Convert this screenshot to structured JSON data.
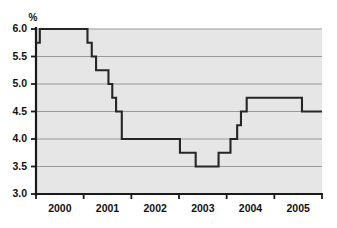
{
  "chart_data": {
    "type": "line",
    "subtype": "step",
    "title": "",
    "subtitle": "",
    "xlabel": "",
    "ylabel": "%",
    "ylim": [
      3.0,
      6.0
    ],
    "xlim": [
      1999.5,
      2005.5
    ],
    "grid": true,
    "legend": null,
    "y_ticks": [
      "6.0",
      "5.5",
      "5.0",
      "4.5",
      "4.0",
      "3.5",
      "3.0"
    ],
    "y_tick_values": [
      6.0,
      5.5,
      5.0,
      4.5,
      4.0,
      3.5,
      3.0
    ],
    "x_ticks": [
      "2000",
      "2001",
      "2002",
      "2003",
      "2004",
      "2005"
    ],
    "x_tick_values": [
      2000,
      2001,
      2002,
      2003,
      2004,
      2005
    ],
    "x_tick_mark_values": [
      1999.5,
      2000.5,
      2001.5,
      2002.5,
      2003.5,
      2004.5,
      2005.5
    ],
    "series": [
      {
        "name": "rate",
        "step": "post",
        "points": [
          {
            "x": 1999.5,
            "y": 5.75
          },
          {
            "x": 1999.58,
            "y": 6.0
          },
          {
            "x": 2000.58,
            "y": 5.75
          },
          {
            "x": 2000.67,
            "y": 5.5
          },
          {
            "x": 2000.76,
            "y": 5.25
          },
          {
            "x": 2001.02,
            "y": 5.0
          },
          {
            "x": 2001.1,
            "y": 4.75
          },
          {
            "x": 2001.18,
            "y": 4.5
          },
          {
            "x": 2001.3,
            "y": 4.0
          },
          {
            "x": 2002.52,
            "y": 3.75
          },
          {
            "x": 2002.85,
            "y": 3.5
          },
          {
            "x": 2003.33,
            "y": 3.75
          },
          {
            "x": 2003.58,
            "y": 4.0
          },
          {
            "x": 2003.72,
            "y": 4.25
          },
          {
            "x": 2003.8,
            "y": 4.5
          },
          {
            "x": 2003.92,
            "y": 4.75
          },
          {
            "x": 2005.08,
            "y": 4.5
          },
          {
            "x": 2005.5,
            "y": 4.5
          }
        ]
      }
    ],
    "colors": {
      "plot_background": "#e6e6e6",
      "page_background": "#ffffff",
      "gridline": "#9a9a9a",
      "axis": "#1a1a1a",
      "series_line": "#262626",
      "tick_label": "#111111"
    },
    "annotations": []
  },
  "axis": {
    "y_unit_label": "%"
  }
}
